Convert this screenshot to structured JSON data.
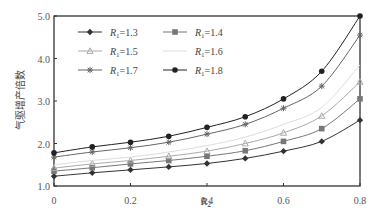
{
  "chart_data": {
    "type": "line",
    "title": "",
    "xlabel": "R2",
    "xlabel_main": "R",
    "xlabel_sub": "2",
    "ylabel": "气驱增产倍数",
    "xlim": [
      0,
      0.8
    ],
    "ylim": [
      1.0,
      5.0
    ],
    "xticks": [
      "0",
      "0.2",
      "0.4",
      "0.6",
      "0.8"
    ],
    "yticks": [
      "1.0",
      "2.0",
      "3.0",
      "4.0",
      "5.0"
    ],
    "grid": false,
    "legend_position": "upper-left",
    "x": [
      0,
      0.1,
      0.2,
      0.3,
      0.4,
      0.5,
      0.6,
      0.7,
      0.8
    ],
    "series": [
      {
        "name": "R1=1.3",
        "label_main": "R",
        "label_sub": "1",
        "label_val": "=1.3",
        "marker": "diamond",
        "color": "#333333",
        "values": [
          1.23,
          1.31,
          1.38,
          1.45,
          1.53,
          1.65,
          1.82,
          2.05,
          2.55
        ]
      },
      {
        "name": "R1=1.4",
        "label_main": "R",
        "label_sub": "1",
        "label_val": "=1.4",
        "marker": "square",
        "color": "#777777",
        "values": [
          1.35,
          1.43,
          1.52,
          1.6,
          1.7,
          1.83,
          2.05,
          2.35,
          3.05
        ]
      },
      {
        "name": "R1=1.5",
        "label_main": "R",
        "label_sub": "1",
        "label_val": "=1.5",
        "marker": "triangle",
        "color": "#aaaaaa",
        "values": [
          1.42,
          1.52,
          1.6,
          1.7,
          1.82,
          2.0,
          2.25,
          2.65,
          3.45
        ]
      },
      {
        "name": "R1=1.6",
        "label_main": "R",
        "label_sub": "1",
        "label_val": "=1.6",
        "marker": "none",
        "color": "#dddddd",
        "values": [
          1.5,
          1.6,
          1.68,
          1.8,
          1.95,
          2.15,
          2.45,
          2.85,
          3.85
        ]
      },
      {
        "name": "R1=1.7",
        "label_main": "R",
        "label_sub": "1",
        "label_val": "=1.7",
        "marker": "star",
        "color": "#666666",
        "values": [
          1.68,
          1.8,
          1.9,
          2.03,
          2.22,
          2.45,
          2.83,
          3.35,
          4.55
        ]
      },
      {
        "name": "R1=1.8",
        "label_main": "R",
        "label_sub": "1",
        "label_val": "=1.8",
        "marker": "circle",
        "color": "#222222",
        "values": [
          1.78,
          1.92,
          2.03,
          2.17,
          2.38,
          2.63,
          3.05,
          3.7,
          5.0
        ]
      }
    ]
  }
}
